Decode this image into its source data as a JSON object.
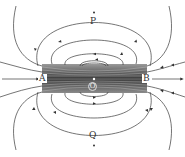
{
  "diagram": {
    "type": "magnetic-field-lines",
    "labels": {
      "top": "P",
      "bottom": "Q",
      "left": "A",
      "right": "B",
      "center": "O"
    },
    "colors": {
      "line": "#3a3a3a",
      "bar_dark": "#3c3c3c",
      "bar_light": "#bfbfbf",
      "background": "#ffffff"
    },
    "bar": {
      "x": 42,
      "y": 64,
      "width": 105,
      "height": 29
    },
    "loops_above": 4,
    "loops_below": 4,
    "external_lines_each_side": 5
  }
}
